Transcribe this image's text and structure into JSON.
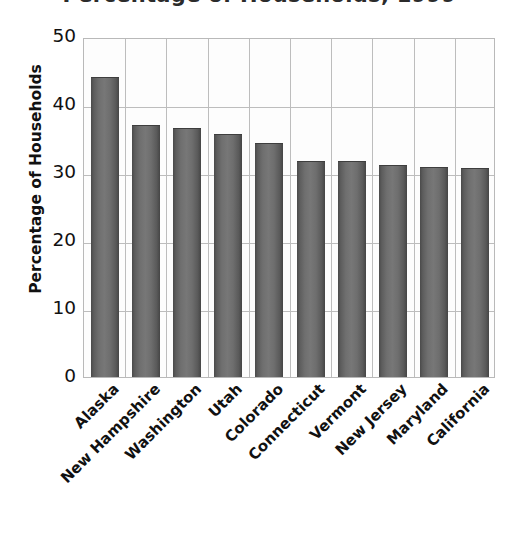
{
  "chart_data": {
    "type": "bar",
    "title": "Percentage of Households, 1999",
    "xlabel": "",
    "ylabel": "Percentage of Households",
    "categories": [
      "Alaska",
      "New Hampshire",
      "Washington",
      "Utah",
      "Colorado",
      "Connecticut",
      "Vermont",
      "New Jersey",
      "Maryland",
      "California"
    ],
    "values": [
      44.1,
      37.0,
      36.6,
      35.8,
      34.4,
      31.7,
      31.7,
      31.2,
      30.9,
      30.7
    ],
    "ylim": [
      0,
      50
    ],
    "yticks": [
      0,
      10,
      20,
      30,
      40,
      50
    ],
    "ytick_labels": [
      "0",
      "10",
      "20",
      "30",
      "40",
      "50"
    ],
    "grid": true,
    "grid_axis": "both",
    "legend": false,
    "bar_color": "#6b6b6b",
    "grid_color": "#bdbdbd",
    "plot_background": "#fdfdfd"
  }
}
